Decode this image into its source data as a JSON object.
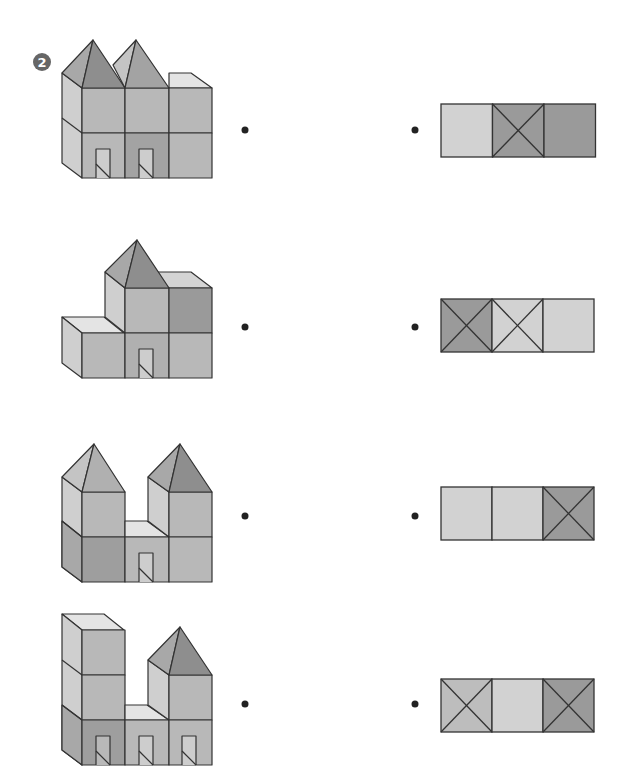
{
  "exercise": {
    "number": "2",
    "instruction_visible": false
  },
  "colors": {
    "stroke": "#333333",
    "top_light": "#e4e4e4",
    "side_light": "#cfcfcf",
    "front_mid": "#b8b8b8",
    "front_dark": "#9e9e9e",
    "roof_left": "#a8a8a8",
    "roof_right": "#8e8e8e",
    "door_inner": "#c8c8c8",
    "dot": "#222222",
    "tile_light": "#d2d2d2",
    "tile_mid": "#bdbdbd",
    "tile_dark": "#9a9a9a"
  },
  "rows": [
    {
      "id": "row-1",
      "figure": "three-column building, two pyramid roofs on left and middle columns, two arched doors",
      "left_dot": {
        "x": 245,
        "y": 130
      },
      "right_dot": {
        "x": 415,
        "y": 130
      },
      "top_view": {
        "x": 441,
        "y": 104,
        "cell": 51.5,
        "height": 53,
        "tiles": [
          {
            "shade": "light",
            "cross": false
          },
          {
            "shade": "dark",
            "cross": true
          },
          {
            "shade": "dark",
            "cross": false
          }
        ]
      }
    },
    {
      "id": "row-2",
      "figure": "step building, low block on left, pyramid roof on middle column, one door",
      "left_dot": {
        "x": 245,
        "y": 327
      },
      "right_dot": {
        "x": 415,
        "y": 327
      },
      "top_view": {
        "x": 441,
        "y": 299,
        "cell": 51,
        "height": 53,
        "tiles": [
          {
            "shade": "dark",
            "cross": true
          },
          {
            "shade": "light",
            "cross": true
          },
          {
            "shade": "light",
            "cross": false
          }
        ]
      }
    },
    {
      "id": "row-3",
      "figure": "two towers with pyramid roofs joined by low middle block with one door",
      "left_dot": {
        "x": 245,
        "y": 516
      },
      "right_dot": {
        "x": 415,
        "y": 516
      },
      "top_view": {
        "x": 441,
        "y": 487,
        "cell": 51,
        "height": 53,
        "tiles": [
          {
            "shade": "light",
            "cross": false
          },
          {
            "shade": "light",
            "cross": false
          },
          {
            "shade": "dark",
            "cross": true
          }
        ]
      }
    },
    {
      "id": "row-4",
      "figure": "tall flat tower left, low middle block, tower with pyramid roof right, three doors",
      "left_dot": {
        "x": 245,
        "y": 704
      },
      "right_dot": {
        "x": 415,
        "y": 704
      },
      "top_view": {
        "x": 441,
        "y": 679,
        "cell": 51,
        "height": 53,
        "tiles": [
          {
            "shade": "mid",
            "cross": true
          },
          {
            "shade": "light",
            "cross": false
          },
          {
            "shade": "dark",
            "cross": true
          }
        ]
      }
    }
  ]
}
